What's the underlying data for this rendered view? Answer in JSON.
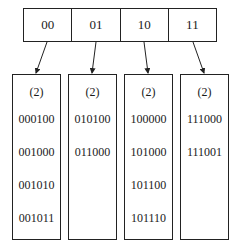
{
  "directory": {
    "cells": [
      "00",
      "01",
      "10",
      "11"
    ]
  },
  "buckets": [
    {
      "depth": "(2)",
      "keys": [
        "000100",
        "001000",
        "001010",
        "001011"
      ]
    },
    {
      "depth": "(2)",
      "keys": [
        "010100",
        "011000"
      ]
    },
    {
      "depth": "(2)",
      "keys": [
        "100000",
        "101000",
        "101100",
        "101110"
      ]
    },
    {
      "depth": "(2)",
      "keys": [
        "111000",
        "111001"
      ]
    }
  ],
  "colors": {
    "line": "#222222",
    "background": "#ffffff"
  }
}
